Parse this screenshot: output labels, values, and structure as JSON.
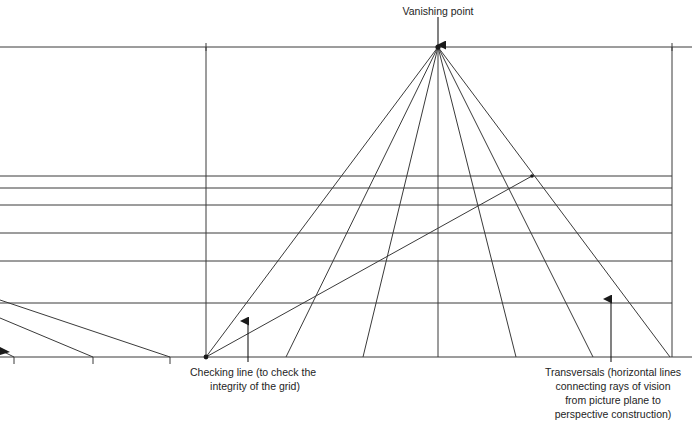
{
  "figure": {
    "type": "diagram",
    "background_color": "#ffffff",
    "line_color": "#3a3a3a",
    "text_color": "#242424"
  },
  "labels": {
    "vanishing_point": "Vanishing point",
    "checking_line_line1": "Checking line (to check the",
    "checking_line_line2": "integrity of the grid)",
    "transversals_line1": "Transversals (horizontal lines",
    "transversals_line2": "connecting rays of vision",
    "transversals_line3": "from picture plane to",
    "transversals_line4": "perspective construction)"
  },
  "geometry": {
    "frame": {
      "horizon_y": 47,
      "baseline_y": 357,
      "left_x": 0,
      "right_x": 672,
      "picture_plane_x": 206
    },
    "vanishing_point": {
      "x": 438,
      "y": 47
    },
    "rays": [
      {
        "name": "ray-1",
        "x_base": 206
      },
      {
        "name": "ray-2",
        "x_base": 286
      },
      {
        "name": "ray-3",
        "x_base": 363
      },
      {
        "name": "ray-4",
        "x_base": 438
      },
      {
        "name": "ray-5",
        "x_base": 516
      },
      {
        "name": "ray-6",
        "x_base": 593
      },
      {
        "name": "ray-7",
        "x_base": 670
      }
    ],
    "transversals_y": [
      176,
      188,
      205,
      233,
      261,
      303
    ],
    "left_diagonals": [
      {
        "name": "left-diagonal-1",
        "y_left": 300,
        "x_base": 170
      },
      {
        "name": "left-diagonal-2",
        "y_left": 318,
        "x_base": 93
      },
      {
        "name": "left-diagonal-3",
        "y_left": 350,
        "x_base": 14
      }
    ],
    "baseline_ticks_x": [
      14,
      93,
      170
    ],
    "checking_line": {
      "x1": 206,
      "y1": 357,
      "x2": 532,
      "y2": 176
    }
  },
  "annotations": {
    "vanishing_point_arrow": {
      "x": 438,
      "y_from": 18,
      "y_to": 44
    },
    "checking_line_arrow": {
      "x": 248,
      "y_from": 362,
      "y_to": 322
    },
    "transversals_arrow": {
      "x": 611,
      "y_from": 362,
      "y_to": 300
    }
  }
}
